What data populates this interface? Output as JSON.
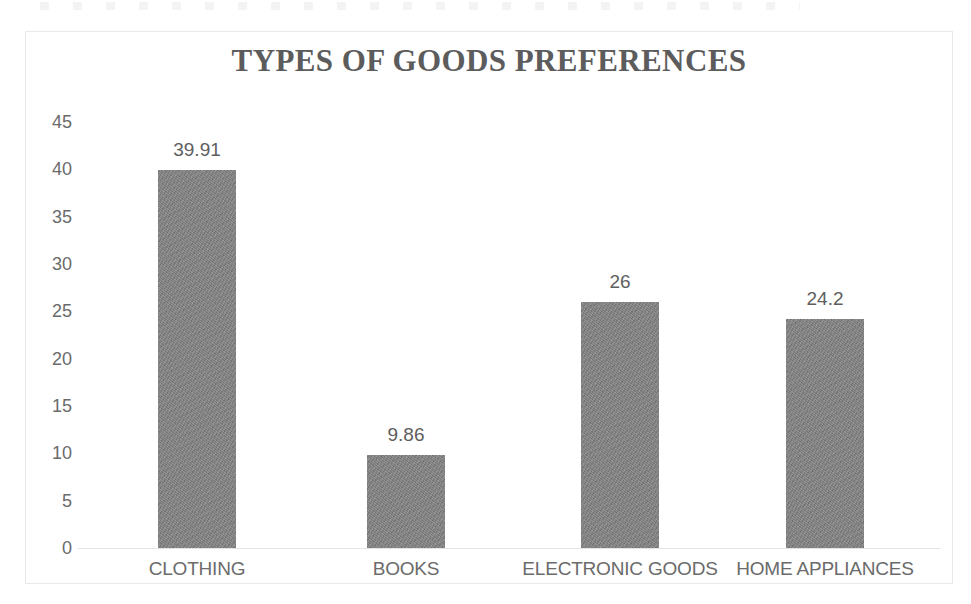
{
  "chart_data": {
    "type": "bar",
    "title": "TYPES OF GOODS PREFERENCES",
    "categories": [
      "CLOTHING",
      "BOOKS",
      "ELECTRONIC GOODS",
      "HOME APPLIANCES"
    ],
    "values": [
      39.91,
      9.86,
      26,
      24.2
    ],
    "value_labels": [
      "39.91",
      "9.86",
      "26",
      "24.2"
    ],
    "xlabel": "",
    "ylabel": "",
    "ylim": [
      0,
      45
    ],
    "ytick_labels": [
      "45",
      "40",
      "35",
      "30",
      "25",
      "20",
      "15",
      "10",
      "5",
      "0"
    ],
    "ytick_values": [
      45,
      40,
      35,
      30,
      25,
      20,
      15,
      10,
      5,
      0
    ],
    "grid": false,
    "legend": null,
    "bar_color": "#7f7f7f",
    "title_color": "#5c5c5c",
    "label_color": "#6b6b6b",
    "axis_line_color": "#e4e4e7",
    "frame_color": "#e9e9ec",
    "background_color": "#ffffff"
  }
}
